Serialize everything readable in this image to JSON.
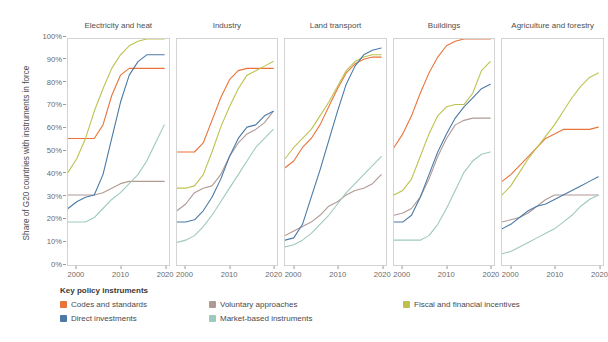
{
  "axis": {
    "ylabel": "Share of G20 countries with instruments in force",
    "yticks": [
      "0%",
      "10%",
      "20%",
      "30%",
      "40%",
      "50%",
      "60%",
      "70%",
      "80%",
      "90%",
      "100%"
    ],
    "xticks": [
      "2000",
      "2010",
      "2020"
    ]
  },
  "legend": {
    "title": "Key policy instruments",
    "items": [
      {
        "label": "Codes and standards",
        "color": "#e8743b"
      },
      {
        "label": "Voluntary approaches",
        "color": "#b09a94"
      },
      {
        "label": "Fiscal and financial incentives",
        "color": "#bdc24f"
      },
      {
        "label": "Direct investments",
        "color": "#4b7aa7"
      },
      {
        "label": "Market-based instruments",
        "color": "#9ec9bd"
      }
    ]
  },
  "chart_data": {
    "type": "line",
    "title": "",
    "xlabel": "",
    "ylabel": "Share of G20 countries with instruments in force",
    "xlim": [
      1998,
      2021
    ],
    "ylim": [
      0,
      100
    ],
    "grid": false,
    "legend_position": "bottom-left",
    "x": [
      1998,
      2000,
      2002,
      2004,
      2006,
      2008,
      2010,
      2012,
      2014,
      2016,
      2018,
      2020
    ],
    "panels": [
      {
        "name": "Electricity and heat",
        "series": [
          {
            "name": "Codes and standards",
            "color": "#e8743b",
            "values": [
              56,
              56,
              56,
              56,
              62,
              75,
              84,
              87,
              87,
              87,
              87,
              87
            ]
          },
          {
            "name": "Voluntary approaches",
            "color": "#b09a94",
            "values": [
              31,
              31,
              31,
              31,
              32,
              34,
              36,
              37,
              37,
              37,
              37,
              37
            ]
          },
          {
            "name": "Fiscal and financial incentives",
            "color": "#bdc24f",
            "values": [
              41,
              47,
              56,
              68,
              78,
              87,
              93,
              97,
              99,
              100,
              100,
              100
            ]
          },
          {
            "name": "Direct investments",
            "color": "#4b7aa7",
            "values": [
              25,
              28,
              30,
              31,
              40,
              56,
              72,
              84,
              90,
              93,
              93,
              93
            ]
          },
          {
            "name": "Market-based instruments",
            "color": "#9ec9bd",
            "values": [
              19,
              19,
              19,
              21,
              25,
              29,
              32,
              36,
              40,
              46,
              54,
              62
            ]
          }
        ]
      },
      {
        "name": "Industry",
        "series": [
          {
            "name": "Codes and standards",
            "color": "#e8743b",
            "values": [
              50,
              50,
              50,
              54,
              64,
              74,
              82,
              86,
              87,
              87,
              87,
              87
            ]
          },
          {
            "name": "Voluntary approaches",
            "color": "#b09a94",
            "values": [
              24,
              27,
              32,
              34,
              35,
              40,
              48,
              54,
              58,
              60,
              63,
              68
            ]
          },
          {
            "name": "Fiscal and financial incentives",
            "color": "#bdc24f",
            "values": [
              34,
              34,
              35,
              40,
              50,
              61,
              70,
              78,
              84,
              86,
              88,
              90
            ]
          },
          {
            "name": "Direct investments",
            "color": "#4b7aa7",
            "values": [
              19,
              19,
              20,
              24,
              30,
              38,
              48,
              56,
              61,
              62,
              66,
              68
            ]
          },
          {
            "name": "Market-based instruments",
            "color": "#9ec9bd",
            "values": [
              10,
              11,
              13,
              17,
              22,
              28,
              34,
              40,
              46,
              52,
              56,
              60
            ]
          }
        ]
      },
      {
        "name": "Land transport",
        "series": [
          {
            "name": "Codes and standards",
            "color": "#e8743b",
            "values": [
              43,
              46,
              52,
              56,
              62,
              70,
              78,
              85,
              89,
              91,
              92,
              92
            ]
          },
          {
            "name": "Voluntary approaches",
            "color": "#b09a94",
            "values": [
              13,
              15,
              17,
              19,
              22,
              26,
              28,
              31,
              33,
              34,
              36,
              40
            ]
          },
          {
            "name": "Fiscal and financial incentives",
            "color": "#bdc24f",
            "values": [
              47,
              52,
              56,
              60,
              66,
              72,
              79,
              86,
              90,
              92,
              93,
              93
            ]
          },
          {
            "name": "Direct investments",
            "color": "#4b7aa7",
            "values": [
              11,
              12,
              18,
              30,
              42,
              55,
              68,
              80,
              88,
              93,
              95,
              96
            ]
          },
          {
            "name": "Market-based instruments",
            "color": "#9ec9bd",
            "values": [
              8,
              9,
              11,
              14,
              18,
              22,
              27,
              32,
              36,
              40,
              44,
              48
            ]
          }
        ]
      },
      {
        "name": "Buildings",
        "series": [
          {
            "name": "Codes and standards",
            "color": "#e8743b",
            "values": [
              52,
              58,
              66,
              76,
              85,
              92,
              97,
              99,
              100,
              100,
              100,
              100
            ]
          },
          {
            "name": "Voluntary approaches",
            "color": "#b09a94",
            "values": [
              22,
              23,
              25,
              30,
              38,
              48,
              56,
              62,
              64,
              65,
              65,
              65
            ]
          },
          {
            "name": "Fiscal and financial incentives",
            "color": "#bdc24f",
            "values": [
              31,
              33,
              38,
              48,
              58,
              66,
              70,
              71,
              71,
              76,
              86,
              90
            ]
          },
          {
            "name": "Direct investments",
            "color": "#4b7aa7",
            "values": [
              19,
              19,
              22,
              30,
              40,
              50,
              58,
              65,
              70,
              74,
              78,
              80
            ]
          },
          {
            "name": "Market-based instruments",
            "color": "#9ec9bd",
            "values": [
              11,
              11,
              11,
              11,
              13,
              18,
              25,
              33,
              41,
              46,
              49,
              50
            ]
          }
        ]
      },
      {
        "name": "Agriculture and forestry",
        "series": [
          {
            "name": "Codes and standards",
            "color": "#e8743b",
            "values": [
              37,
              40,
              44,
              48,
              52,
              56,
              58,
              60,
              60,
              60,
              60,
              61
            ]
          },
          {
            "name": "Voluntary approaches",
            "color": "#b09a94",
            "values": [
              19,
              20,
              21,
              23,
              26,
              29,
              31,
              31,
              31,
              31,
              31,
              31
            ]
          },
          {
            "name": "Fiscal and financial incentives",
            "color": "#bdc24f",
            "values": [
              31,
              35,
              41,
              47,
              52,
              57,
              62,
              68,
              74,
              79,
              83,
              85
            ]
          },
          {
            "name": "Direct investments",
            "color": "#4b7aa7",
            "values": [
              16,
              18,
              21,
              24,
              26,
              27,
              29,
              31,
              33,
              35,
              37,
              39
            ]
          },
          {
            "name": "Market-based instruments",
            "color": "#9ec9bd",
            "values": [
              5,
              6,
              8,
              10,
              12,
              14,
              16,
              19,
              22,
              26,
              29,
              31
            ]
          }
        ]
      }
    ]
  }
}
